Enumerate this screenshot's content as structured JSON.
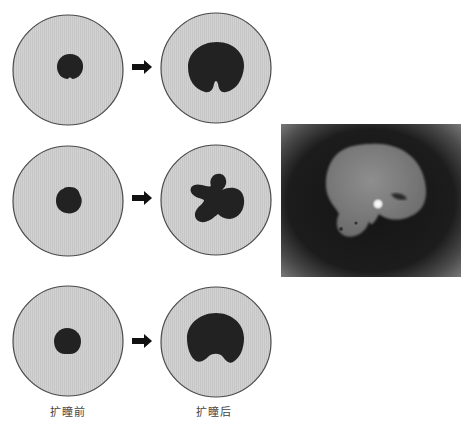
{
  "figure": {
    "colors": {
      "iris_fill": "#cfcfcf",
      "iris_stroke": "#4a4a4a",
      "pupil": "#222222",
      "arrow": "#111111",
      "label": "#444444"
    },
    "rows": [
      {
        "before": {
          "cx": 68,
          "cy": 70,
          "pupil_shape": "small-round-notched"
        },
        "after": {
          "cx": 216,
          "cy": 68,
          "pupil_shape": "dilated-keyhole-notch"
        }
      },
      {
        "before": {
          "cx": 68,
          "cy": 201,
          "pupil_shape": "small-irregular-round"
        },
        "after": {
          "cx": 216,
          "cy": 200,
          "pupil_shape": "dilated-irregular-lobed"
        }
      },
      {
        "before": {
          "cx": 68,
          "cy": 341,
          "pupil_shape": "small-round-flat-bottom"
        },
        "after": {
          "cx": 216,
          "cy": 342,
          "pupil_shape": "dilated-bilobed-notch"
        }
      }
    ],
    "labels": {
      "before": "扩瞳前",
      "after": "扩瞳后"
    },
    "arrow_icon": "right-arrow-icon",
    "photo": {
      "description": "Slit-lamp photograph of irregularly dilated pupil with corneal light reflex",
      "x": 281,
      "y": 124,
      "width": 180,
      "height": 153
    }
  }
}
